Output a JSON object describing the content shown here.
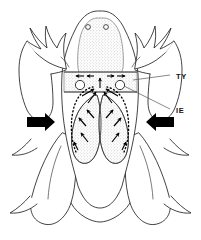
{
  "figure": {
    "view": "ventral",
    "background_color": "#ffffff",
    "line_color": "#111111",
    "fill_color": "#ffffff",
    "stipple_color": "#7a7a7a",
    "arrow_color": "#000000"
  },
  "labels": [
    {
      "id": "TY",
      "text": "TY",
      "meaning": "tympanum",
      "x": 176,
      "y": 77,
      "leader": {
        "from_x": 172,
        "from_y": 75,
        "to_x": 133,
        "to_y": 80,
        "style": "straight"
      }
    },
    {
      "id": "IE",
      "text": "IE",
      "meaning": "inner ear",
      "x": 176,
      "y": 112,
      "leader": {
        "from_x": 172,
        "from_y": 109,
        "to_x": 125,
        "to_y": 85,
        "style": "straight"
      }
    }
  ],
  "markers": {
    "nostrils": [
      {
        "name": "nostril-left",
        "cx": 88,
        "cy": 27,
        "r": 2.4
      },
      {
        "name": "nostril-right",
        "cx": 106,
        "cy": 27,
        "r": 2.4
      }
    ],
    "tympana": [
      {
        "name": "tympanum-left",
        "cx": 80,
        "cy": 85,
        "r": 4.6
      },
      {
        "name": "tympanum-right",
        "cx": 120,
        "cy": 85,
        "r": 4.6
      }
    ]
  },
  "external_sound_arrows": [
    {
      "name": "external-arrow-left",
      "direction": "right",
      "x": 39,
      "y": 122
    },
    {
      "name": "external-arrow-right",
      "direction": "left",
      "x": 150,
      "y": 122
    }
  ],
  "internal_arrow_paths": {
    "description": "dotted arrow paths from lungs converging to inner ear region",
    "count": 4
  },
  "stippled_regions": [
    {
      "name": "head-torso-stipple"
    },
    {
      "name": "lung-left-stipple"
    },
    {
      "name": "lung-right-stipple"
    }
  ]
}
